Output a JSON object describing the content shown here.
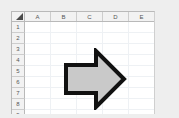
{
  "app": {
    "type": "spreadsheet",
    "background_color": "#eeeeee",
    "sheet_background": "#ffffff",
    "header_background": "#f2f2f2",
    "header_text_color": "#555555",
    "gridline_color": "#eef1f4",
    "frame_color": "#b9b9b9"
  },
  "grid": {
    "select_all_corner": "",
    "columns": [
      {
        "label": "A"
      },
      {
        "label": "B"
      },
      {
        "label": "C"
      },
      {
        "label": "D"
      },
      {
        "label": "E"
      }
    ],
    "rows": [
      {
        "label": "1",
        "cells": [
          "",
          "",
          "",
          "",
          ""
        ]
      },
      {
        "label": "2",
        "cells": [
          "",
          "",
          "",
          "",
          ""
        ]
      },
      {
        "label": "3",
        "cells": [
          "",
          "",
          "",
          "",
          ""
        ]
      },
      {
        "label": "4",
        "cells": [
          "",
          "",
          "",
          "",
          ""
        ]
      },
      {
        "label": "5",
        "cells": [
          "",
          "",
          "",
          "",
          ""
        ]
      },
      {
        "label": "6",
        "cells": [
          "",
          "",
          "",
          "",
          ""
        ]
      },
      {
        "label": "7",
        "cells": [
          "",
          "",
          "",
          "",
          ""
        ]
      },
      {
        "label": "8",
        "cells": [
          "",
          "",
          "",
          "",
          ""
        ]
      },
      {
        "label": "9",
        "cells": [
          "",
          "",
          "",
          "",
          ""
        ]
      }
    ]
  },
  "shape": {
    "name": "right-arrow",
    "kind": "block-arrow",
    "direction": "right",
    "fill_color": "#c9c9c9",
    "outline_color": "#111111",
    "outline_width": 4,
    "spans_columns": "B-C",
    "spans_rows": "3-8"
  }
}
